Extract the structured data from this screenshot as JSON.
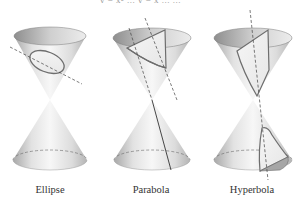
{
  "header": {
    "clipped_text": "y = x² ... y = x ... ..."
  },
  "figure": {
    "colors": {
      "cone_light": "#f4f4f4",
      "cone_mid": "#d8d8d8",
      "cone_dark": "#9a9a9a",
      "outline": "#555555",
      "section_stroke": "#6e6e6e",
      "plane_line": "#444444",
      "label": "#333333"
    },
    "panels": [
      {
        "id": "ellipse",
        "label": "Ellipse"
      },
      {
        "id": "parabola",
        "label": "Parabola"
      },
      {
        "id": "hyperbola",
        "label": "Hyperbola"
      }
    ]
  }
}
